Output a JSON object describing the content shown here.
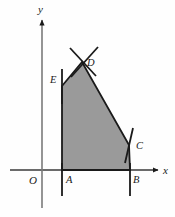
{
  "figure": {
    "background_color": "#fefefe",
    "stroke_color": "#1a1a1a",
    "fill_color": "#9a9a9a",
    "axes": {
      "x_axis_label": "x",
      "y_axis_label": "y",
      "origin_label": "O",
      "origin_px": {
        "x": 42,
        "y": 170
      },
      "x_axis_line": {
        "x1": 10,
        "y1": 170,
        "x2": 158,
        "y2": 170
      },
      "y_axis_line": {
        "x1": 42,
        "y1": 20,
        "x2": 42,
        "y2": 208
      },
      "x_label_px": {
        "x": 163,
        "y": 174
      },
      "y_label_px": {
        "x": 38,
        "y": 13
      },
      "origin_label_px": {
        "x": 29,
        "y": 184
      }
    },
    "polygon": {
      "name": "ABCDE",
      "vertices": [
        {
          "label": "A",
          "x": 62,
          "y": 170,
          "label_x": 66,
          "label_y": 183
        },
        {
          "label": "B",
          "x": 130,
          "y": 170,
          "label_x": 133,
          "label_y": 183
        },
        {
          "label": "C",
          "x": 129,
          "y": 145,
          "label_x": 136,
          "label_y": 149
        },
        {
          "label": "D",
          "x": 82,
          "y": 62,
          "label_x": 87,
          "label_y": 66
        },
        {
          "label": "E",
          "x": 62,
          "y": 86,
          "label_x": 50,
          "label_y": 83
        }
      ],
      "points_path": "62,170 130,170 129,145 82,62 62,86"
    },
    "tick_marks": [
      {
        "name": "tick-at-A",
        "x1": 62,
        "y1": 163,
        "x2": 62,
        "y2": 196
      },
      {
        "name": "tick-at-B",
        "x1": 130,
        "y1": 163,
        "x2": 130,
        "y2": 196
      },
      {
        "name": "tick-at-E",
        "x1": 62,
        "y1": 69,
        "x2": 62,
        "y2": 104
      },
      {
        "name": "tick-at-C",
        "x1": 133,
        "y1": 128,
        "x2": 125,
        "y2": 163
      },
      {
        "name": "tick-at-D-left",
        "x1": 70,
        "y1": 48,
        "x2": 96,
        "y2": 76
      },
      {
        "name": "tick-at-D-right",
        "x1": 98,
        "y1": 47,
        "x2": 71,
        "y2": 77
      }
    ]
  }
}
